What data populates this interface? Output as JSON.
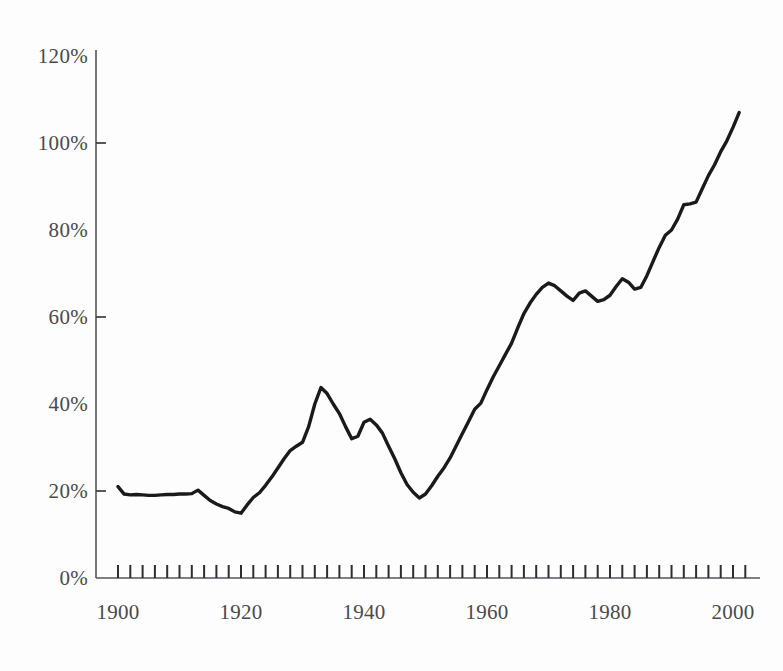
{
  "chart_data": {
    "type": "line",
    "title": "",
    "subtitle": "",
    "xlabel": "",
    "ylabel": "",
    "xlim": [
      1898,
      2002
    ],
    "ylim": [
      0,
      120
    ],
    "grid": false,
    "legend": null,
    "y_tick_labels": [
      "120%",
      "100%",
      "80%",
      "60%",
      "40%",
      "20%",
      "0%"
    ],
    "y_ticks": [
      120,
      100,
      80,
      60,
      40,
      20,
      0
    ],
    "x_tick_labels": [
      "1900",
      "1920",
      "1940",
      "1960",
      "1980",
      "2000"
    ],
    "x_ticks": [
      1900,
      1920,
      1940,
      1960,
      1980,
      2000
    ],
    "x_minor_tick_step": 2,
    "line_color": "#1a1a1a",
    "line_width": 3.4,
    "series": [
      {
        "name": "value",
        "x": [
          1900,
          1901,
          1902,
          1903,
          1904,
          1905,
          1906,
          1907,
          1908,
          1909,
          1910,
          1911,
          1912,
          1913,
          1914,
          1915,
          1916,
          1917,
          1918,
          1919,
          1920,
          1921,
          1922,
          1923,
          1924,
          1925,
          1926,
          1927,
          1928,
          1929,
          1930,
          1931,
          1932,
          1933,
          1934,
          1935,
          1936,
          1937,
          1938,
          1939,
          1940,
          1941,
          1942,
          1943,
          1944,
          1945,
          1946,
          1947,
          1948,
          1949,
          1950,
          1951,
          1952,
          1953,
          1954,
          1955,
          1956,
          1957,
          1958,
          1959,
          1960,
          1961,
          1962,
          1963,
          1964,
          1965,
          1966,
          1967,
          1968,
          1969,
          1970,
          1971,
          1972,
          1973,
          1974,
          1975,
          1976,
          1977,
          1978,
          1979,
          1980,
          1981,
          1982,
          1983,
          1984,
          1985,
          1986,
          1987,
          1988,
          1989,
          1990,
          1991,
          1992,
          1993,
          1994,
          1995,
          1996,
          1997,
          1998,
          1999,
          2000,
          2001
        ],
        "values": [
          21.0,
          19.3,
          19.1,
          19.2,
          19.1,
          19.0,
          19.0,
          19.1,
          19.2,
          19.2,
          19.3,
          19.3,
          19.4,
          20.2,
          19.0,
          17.8,
          17.0,
          16.4,
          16.0,
          15.2,
          14.9,
          16.8,
          18.5,
          19.6,
          21.3,
          23.2,
          25.3,
          27.4,
          29.3,
          30.3,
          31.2,
          34.8,
          40.0,
          43.8,
          42.4,
          40.0,
          37.8,
          34.8,
          32.0,
          32.6,
          35.8,
          36.5,
          35.2,
          33.3,
          30.3,
          27.4,
          24.2,
          21.5,
          19.7,
          18.4,
          19.3,
          21.2,
          23.4,
          25.3,
          27.6,
          30.4,
          33.2,
          36.0,
          38.8,
          40.2,
          43.3,
          46.2,
          48.8,
          51.4,
          54.0,
          57.5,
          60.8,
          63.2,
          65.2,
          66.8,
          67.8,
          67.2,
          66.0,
          64.8,
          63.8,
          65.5,
          66.0,
          64.8,
          63.6,
          64.0,
          65.0,
          67.0,
          68.8,
          68.0,
          66.4,
          66.8,
          69.5,
          72.8,
          76.0,
          78.8,
          80.0,
          82.5,
          85.8,
          86.0,
          86.4,
          89.5,
          92.5,
          95.0,
          98.0,
          100.5,
          103.6,
          107.0
        ]
      }
    ]
  },
  "axes": {
    "y_labels": [
      {
        "text": "120%",
        "top": 44
      },
      {
        "text": "100%",
        "top": 131
      },
      {
        "text": "80%",
        "top": 218
      },
      {
        "text": "60%",
        "top": 305
      },
      {
        "text": "40%",
        "top": 392
      },
      {
        "text": "20%",
        "top": 479
      },
      {
        "text": "0%",
        "top": 566
      }
    ],
    "x_labels": [
      {
        "text": "1900",
        "left": 73
      },
      {
        "text": "1920",
        "left": 196
      },
      {
        "text": "1940",
        "left": 319
      },
      {
        "text": "1960",
        "left": 442
      },
      {
        "text": "1980",
        "left": 565
      },
      {
        "text": "2000",
        "left": 688
      }
    ]
  }
}
